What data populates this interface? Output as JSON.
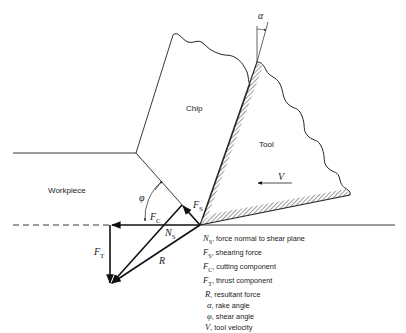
{
  "diagram": {
    "regions": {
      "chip": "Chip",
      "tool": "Tool",
      "workpiece": "Workpiece"
    },
    "symbols": {
      "alpha": "α",
      "phi": "φ",
      "V": "V",
      "R": "R",
      "FS_main": "F",
      "FS_sub": "S",
      "FC_main": "F",
      "FC_sub": "C",
      "NS_main": "N",
      "NS_sub": "S",
      "FT_main": "F",
      "FT_sub": "T"
    },
    "legend": [
      {
        "symbol": "N",
        "sub": "S",
        "text": ", force normal to shear plane"
      },
      {
        "symbol": "F",
        "sub": "S",
        "text": ", shearing force"
      },
      {
        "symbol": "F",
        "sub": "C",
        "text": ", cutting component"
      },
      {
        "symbol": "F",
        "sub": "T",
        "text": ", thrust component"
      },
      {
        "symbol": "R",
        "sub": "",
        "text": ", resultant force"
      },
      {
        "symbol": "α",
        "sub": "",
        "text": ", rake angle"
      },
      {
        "symbol": "φ",
        "sub": "",
        "text": ", shear angle"
      },
      {
        "symbol": "V",
        "sub": "",
        "text": ", tool velocity"
      }
    ]
  }
}
